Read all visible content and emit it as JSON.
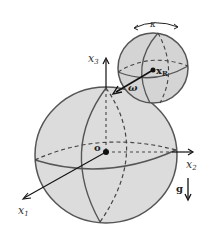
{
  "figure": {
    "type": "diagram",
    "colors": {
      "sphere_fill": "#dcdcdc",
      "sphere_stroke": "#555555",
      "axis": "#111111",
      "background": "#ffffff"
    }
  },
  "labels": {
    "x1": "x",
    "x1_sub": "1",
    "x2": "x",
    "x2_sub": "2",
    "x3": "x",
    "x3_sub": "3",
    "origin": "o",
    "gravity": "g",
    "omega": "ω",
    "xr": "x",
    "xr_sub": "R",
    "kappa": "κ"
  },
  "spheres": {
    "large": {
      "cx": 106,
      "cy": 155,
      "rx": 71,
      "ry": 68
    },
    "small": {
      "cx": 153,
      "cy": 68,
      "r": 35
    }
  }
}
